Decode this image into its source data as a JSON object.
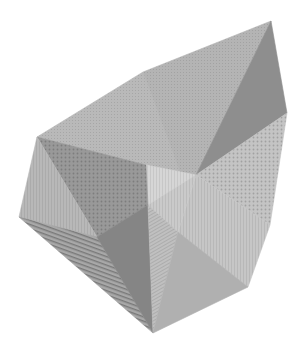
{
  "figure": {
    "background": "#ffffff",
    "facets": [
      {
        "name": "top-left-face",
        "points": "37,137 143,72 182,178 146,165",
        "fill": "#b9b9b9",
        "pattern": "dots-fine"
      },
      {
        "name": "top-ridge-face",
        "points": "143,72 271,21 196,175 182,178",
        "fill": "#b4b4b4",
        "pattern": "dots-fine"
      },
      {
        "name": "top-right-dark-face",
        "points": "271,21 287,113 196,175",
        "fill": "#8e8e8e",
        "pattern": "none"
      },
      {
        "name": "right-dotted-face",
        "points": "287,113 270,225 196,175",
        "fill": "#c4c4c4",
        "pattern": "dots-coarse"
      },
      {
        "name": "right-lower-face",
        "points": "196,175 270,225 248,287 178,232",
        "fill": "#c6c6c6",
        "pattern": "vlines"
      },
      {
        "name": "center-light-face",
        "points": "146,165 196,175 148,205",
        "fill": "#d6d6d6",
        "pattern": "vlines"
      },
      {
        "name": "center-right-face",
        "points": "148,205 196,175 178,232",
        "fill": "#cacaca",
        "pattern": "vlines"
      },
      {
        "name": "left-dark-face",
        "points": "37,137 146,165 148,205 97,237",
        "fill": "#999999",
        "pattern": "dots-coarse"
      },
      {
        "name": "left-face",
        "points": "37,137 97,237 19,217",
        "fill": "#b8b8b8",
        "pattern": "vlines"
      },
      {
        "name": "bottom-left-striped-face",
        "points": "19,217 97,237 153,333",
        "fill": "#a8a8a8",
        "pattern": "hstripes"
      },
      {
        "name": "bottom-dark-face",
        "points": "97,237 148,205 153,333",
        "fill": "#858585",
        "pattern": "none"
      },
      {
        "name": "bottom-center-face",
        "points": "148,205 178,232 153,333",
        "fill": "#c0c0c0",
        "pattern": "diag"
      },
      {
        "name": "bottom-right-face",
        "points": "178,232 248,287 153,333",
        "fill": "#b0b0b0",
        "pattern": "none"
      }
    ]
  }
}
